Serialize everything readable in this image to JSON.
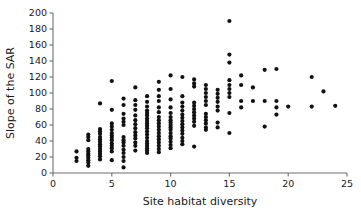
{
  "chart_data": {
    "type": "scatter",
    "title": "",
    "xlabel": "Site habitat diversity",
    "ylabel": "Slope of the SAR",
    "xlim": [
      0,
      25
    ],
    "ylim": [
      0,
      200
    ],
    "xticks": [
      0,
      5,
      10,
      15,
      20,
      25
    ],
    "yticks": [
      0,
      20,
      40,
      60,
      80,
      100,
      120,
      140,
      160,
      180,
      200
    ],
    "xticklabels": [
      "0",
      "5",
      "10",
      "15",
      "20",
      "25"
    ],
    "yticklabels": [
      "0",
      "20",
      "40",
      "60",
      "80",
      "100",
      "120",
      "140",
      "160",
      "180",
      "200"
    ],
    "grid": false,
    "legend": false,
    "marker": "circle",
    "marker_color": "#111111",
    "marker_size": 2.1,
    "points": [
      [
        2,
        27
      ],
      [
        2,
        19
      ],
      [
        2,
        15
      ],
      [
        3,
        48
      ],
      [
        3,
        45
      ],
      [
        3,
        41
      ],
      [
        3,
        30
      ],
      [
        3,
        27
      ],
      [
        3,
        24
      ],
      [
        3,
        22
      ],
      [
        3,
        19
      ],
      [
        3,
        16
      ],
      [
        3,
        13
      ],
      [
        3,
        9
      ],
      [
        4,
        87
      ],
      [
        4,
        55
      ],
      [
        4,
        52
      ],
      [
        4,
        49
      ],
      [
        4,
        45
      ],
      [
        4,
        42
      ],
      [
        4,
        39
      ],
      [
        4,
        36
      ],
      [
        4,
        33
      ],
      [
        4,
        30
      ],
      [
        4,
        27
      ],
      [
        4,
        24
      ],
      [
        4,
        21
      ],
      [
        4,
        17
      ],
      [
        5,
        115
      ],
      [
        5,
        79
      ],
      [
        5,
        62
      ],
      [
        5,
        58
      ],
      [
        5,
        54
      ],
      [
        5,
        50
      ],
      [
        5,
        47
      ],
      [
        5,
        44
      ],
      [
        5,
        41
      ],
      [
        5,
        37
      ],
      [
        5,
        34
      ],
      [
        5,
        31
      ],
      [
        5,
        27
      ],
      [
        5,
        16
      ],
      [
        6,
        93
      ],
      [
        6,
        85
      ],
      [
        6,
        74
      ],
      [
        6,
        68
      ],
      [
        6,
        64
      ],
      [
        6,
        60
      ],
      [
        6,
        45
      ],
      [
        6,
        41
      ],
      [
        6,
        38
      ],
      [
        6,
        34
      ],
      [
        6,
        29
      ],
      [
        6,
        25
      ],
      [
        6,
        20
      ],
      [
        6,
        15
      ],
      [
        6,
        7
      ],
      [
        7,
        107
      ],
      [
        7,
        91
      ],
      [
        7,
        85
      ],
      [
        7,
        79
      ],
      [
        7,
        72
      ],
      [
        7,
        66
      ],
      [
        7,
        61
      ],
      [
        7,
        56
      ],
      [
        7,
        51
      ],
      [
        7,
        47
      ],
      [
        7,
        43
      ],
      [
        7,
        38
      ],
      [
        7,
        34
      ],
      [
        7,
        28
      ],
      [
        8,
        96
      ],
      [
        8,
        89
      ],
      [
        8,
        83
      ],
      [
        8,
        78
      ],
      [
        8,
        75
      ],
      [
        8,
        72
      ],
      [
        8,
        68
      ],
      [
        8,
        65
      ],
      [
        8,
        62
      ],
      [
        8,
        59
      ],
      [
        8,
        56
      ],
      [
        8,
        52
      ],
      [
        8,
        48
      ],
      [
        8,
        44
      ],
      [
        8,
        40
      ],
      [
        8,
        37
      ],
      [
        8,
        34
      ],
      [
        8,
        31
      ],
      [
        8,
        28
      ],
      [
        8,
        25
      ],
      [
        9,
        114
      ],
      [
        9,
        104
      ],
      [
        9,
        96
      ],
      [
        9,
        90
      ],
      [
        9,
        82
      ],
      [
        9,
        76
      ],
      [
        9,
        70
      ],
      [
        9,
        66
      ],
      [
        9,
        62
      ],
      [
        9,
        58
      ],
      [
        9,
        54
      ],
      [
        9,
        50
      ],
      [
        9,
        46
      ],
      [
        9,
        42
      ],
      [
        9,
        38
      ],
      [
        9,
        34
      ],
      [
        9,
        30
      ],
      [
        9,
        26
      ],
      [
        10,
        122
      ],
      [
        10,
        105
      ],
      [
        10,
        92
      ],
      [
        10,
        82
      ],
      [
        10,
        75
      ],
      [
        10,
        70
      ],
      [
        10,
        66
      ],
      [
        10,
        63
      ],
      [
        10,
        60
      ],
      [
        10,
        57
      ],
      [
        10,
        54
      ],
      [
        10,
        50
      ],
      [
        10,
        46
      ],
      [
        10,
        43
      ],
      [
        10,
        39
      ],
      [
        10,
        35
      ],
      [
        10,
        31
      ],
      [
        11,
        120
      ],
      [
        11,
        96
      ],
      [
        11,
        88
      ],
      [
        11,
        83
      ],
      [
        11,
        78
      ],
      [
        11,
        73
      ],
      [
        11,
        69
      ],
      [
        11,
        65
      ],
      [
        11,
        61
      ],
      [
        11,
        57
      ],
      [
        11,
        53
      ],
      [
        11,
        49
      ],
      [
        11,
        44
      ],
      [
        11,
        40
      ],
      [
        11,
        36
      ],
      [
        12,
        117
      ],
      [
        12,
        112
      ],
      [
        12,
        108
      ],
      [
        12,
        88
      ],
      [
        12,
        84
      ],
      [
        12,
        80
      ],
      [
        12,
        76
      ],
      [
        12,
        72
      ],
      [
        12,
        68
      ],
      [
        12,
        64
      ],
      [
        12,
        59
      ],
      [
        12,
        33
      ],
      [
        13,
        110
      ],
      [
        13,
        105
      ],
      [
        13,
        100
      ],
      [
        13,
        95
      ],
      [
        13,
        90
      ],
      [
        13,
        85
      ],
      [
        13,
        74
      ],
      [
        13,
        70
      ],
      [
        13,
        66
      ],
      [
        13,
        62
      ],
      [
        13,
        57
      ],
      [
        13,
        54
      ],
      [
        14,
        104
      ],
      [
        14,
        99
      ],
      [
        14,
        94
      ],
      [
        14,
        89
      ],
      [
        14,
        83
      ],
      [
        14,
        78
      ],
      [
        14,
        63
      ],
      [
        14,
        57
      ],
      [
        15,
        190
      ],
      [
        15,
        148
      ],
      [
        15,
        138
      ],
      [
        15,
        116
      ],
      [
        15,
        110
      ],
      [
        15,
        105
      ],
      [
        15,
        100
      ],
      [
        15,
        95
      ],
      [
        15,
        75
      ],
      [
        15,
        50
      ],
      [
        16,
        122
      ],
      [
        16,
        110
      ],
      [
        16,
        90
      ],
      [
        16,
        82
      ],
      [
        17,
        107
      ],
      [
        17,
        90
      ],
      [
        18,
        129
      ],
      [
        18,
        90
      ],
      [
        18,
        58
      ],
      [
        19,
        130
      ],
      [
        19,
        90
      ],
      [
        19,
        82
      ],
      [
        19,
        73
      ],
      [
        20,
        83
      ],
      [
        22,
        120
      ],
      [
        22,
        83
      ],
      [
        23,
        102
      ],
      [
        24,
        84
      ]
    ]
  },
  "figure": {
    "background_color": "#ffffff",
    "axis_color": "#6e6e6e",
    "text_color": "#1a1a1a"
  }
}
